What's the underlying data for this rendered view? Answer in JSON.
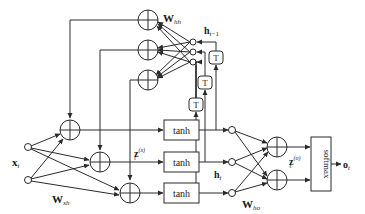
{
  "diagram": {
    "type": "recurrent neural network (Elman RNN) computation graph",
    "colors": {
      "stroke": "#2a2a2a",
      "background": "#ffffff",
      "text": "#1a1a1a"
    },
    "labels": {
      "input": "x",
      "input_sub": "t",
      "w_xh": "W",
      "w_xh_sub": "xh",
      "w_hh": "W",
      "w_hh_sub": "hh",
      "h_prev": "h",
      "h_prev_sub": "t−1",
      "z_x": "z",
      "z_x_sub": "t",
      "z_x_sup": "(x)",
      "h_t": "h",
      "h_t_sub": "t",
      "w_ho": "W",
      "w_ho_sub": "ho",
      "z_o": "z",
      "z_o_sub": "t",
      "z_o_sup": "(o)",
      "output": "o",
      "output_sub": "t"
    },
    "activation_boxes": [
      "tanh",
      "tanh",
      "tanh"
    ],
    "delay_boxes": [
      "T",
      "T",
      "T"
    ],
    "softmax_label": "softmax",
    "sum_symbol": "+",
    "nodes": {
      "input_units": 2,
      "hidden_sum_nodes_from_input": 3,
      "recurrent_sum_nodes": 3,
      "previous_hidden_units": 3,
      "hidden_units": 3,
      "output_sum_nodes": 2
    }
  }
}
